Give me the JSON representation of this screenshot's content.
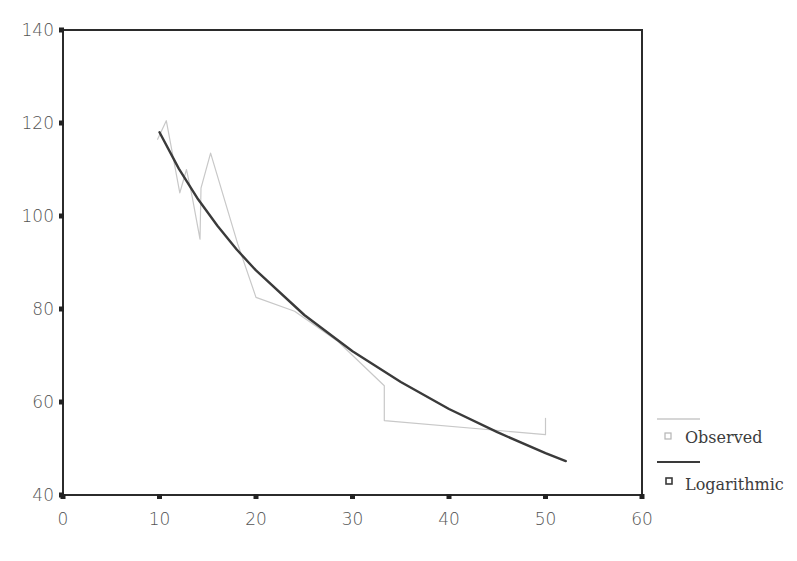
{
  "chart_data": {
    "type": "line",
    "title": "",
    "xlabel": "",
    "ylabel": "",
    "xlim": [
      0,
      60
    ],
    "ylim": [
      40,
      140
    ],
    "x_ticks": [
      0,
      10,
      20,
      30,
      40,
      50,
      60
    ],
    "y_ticks": [
      40,
      60,
      80,
      100,
      120,
      140
    ],
    "grid": false,
    "legend_position": "right-bottom",
    "series": [
      {
        "name": "Observed",
        "style": "thin light gray line",
        "color": "#c8c8c8",
        "x": [
          9.8,
          10.7,
          12.1,
          12.8,
          13.4,
          14.2,
          14.3,
          15.3,
          18.1,
          20.0,
          24.0,
          28.5,
          33.3,
          33.3,
          50.0,
          50.0
        ],
        "y": [
          116.5,
          120.5,
          105.0,
          110.0,
          104.0,
          95.0,
          106.0,
          113.5,
          94.0,
          82.5,
          79.5,
          73.0,
          63.5,
          56.0,
          53.0,
          56.5
        ]
      },
      {
        "name": "Logarithmic",
        "style": "thick dark line (fitted curve y = a + b*ln(x))",
        "color": "#3a3a3a",
        "fit": {
          "a": 216.8,
          "b": -42.9
        },
        "x": [
          10,
          12,
          14,
          16,
          18,
          20,
          25,
          30,
          35,
          40,
          45,
          50,
          52.1
        ],
        "y": [
          118.0,
          110.2,
          103.6,
          97.9,
          92.8,
          88.3,
          78.7,
          70.9,
          64.3,
          58.5,
          53.5,
          49.0,
          47.3
        ]
      }
    ]
  },
  "legend": {
    "items": [
      {
        "label": "Observed"
      },
      {
        "label": "Logarithmic"
      }
    ]
  }
}
